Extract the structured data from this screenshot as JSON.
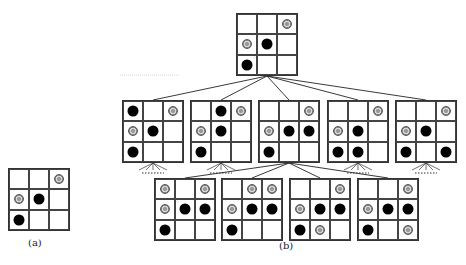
{
  "labels": {
    "a": "(a)",
    "b": "(b)"
  },
  "colors": {
    "black_stone": "#000000",
    "gray_stone": "#999999",
    "grid": "#333333"
  },
  "legend": {
    "black": "black-stone",
    "gray": "gray-stone",
    "empty": ""
  },
  "boards": {
    "a": {
      "x": 8,
      "y": 168,
      "cells": [
        "",
        "",
        "gray",
        "gray",
        "black",
        "",
        "black",
        "",
        ""
      ]
    },
    "root": {
      "x": 236,
      "y": 13,
      "cells": [
        "",
        "",
        "gray",
        "gray",
        "black",
        "",
        "black",
        "",
        ""
      ]
    },
    "mid1": {
      "x": 122,
      "y": 100,
      "cells": [
        "black",
        "",
        "gray",
        "gray",
        "black",
        "",
        "black",
        "",
        ""
      ]
    },
    "mid2": {
      "x": 190,
      "y": 100,
      "cells": [
        "",
        "black",
        "gray",
        "gray",
        "black",
        "",
        "black",
        "",
        ""
      ]
    },
    "mid3": {
      "x": 258,
      "y": 100,
      "cells": [
        "",
        "",
        "gray",
        "gray",
        "black",
        "black",
        "black",
        "",
        ""
      ]
    },
    "mid4": {
      "x": 327,
      "y": 100,
      "cells": [
        "",
        "",
        "gray",
        "gray",
        "black",
        "",
        "black",
        "black",
        ""
      ]
    },
    "mid5": {
      "x": 395,
      "y": 100,
      "cells": [
        "",
        "",
        "gray",
        "gray",
        "black",
        "",
        "black",
        "",
        "black"
      ]
    },
    "bot1": {
      "x": 154,
      "y": 178,
      "cells": [
        "gray",
        "",
        "gray",
        "gray",
        "black",
        "black",
        "black",
        "",
        ""
      ]
    },
    "bot2": {
      "x": 221,
      "y": 178,
      "cells": [
        "",
        "gray",
        "gray",
        "gray",
        "black",
        "black",
        "black",
        "",
        ""
      ]
    },
    "bot3": {
      "x": 289,
      "y": 178,
      "cells": [
        "",
        "",
        "gray",
        "gray",
        "black",
        "black",
        "black",
        "gray",
        ""
      ]
    },
    "bot4": {
      "x": 357,
      "y": 178,
      "cells": [
        "",
        "",
        "gray",
        "gray",
        "black",
        "black",
        "black",
        "",
        "gray"
      ]
    }
  },
  "edges": {
    "root_to_mid": [
      [
        267,
        76,
        153,
        100
      ],
      [
        267,
        76,
        221,
        100
      ],
      [
        267,
        76,
        289,
        100
      ],
      [
        267,
        76,
        358,
        100
      ],
      [
        267,
        76,
        426,
        100
      ]
    ],
    "mid3_to_bot": [
      [
        289,
        163,
        185,
        178
      ],
      [
        289,
        163,
        252,
        178
      ],
      [
        289,
        163,
        320,
        178
      ],
      [
        289,
        163,
        388,
        178
      ]
    ],
    "stubs": [
      {
        "cx": 153,
        "y": 163,
        "dots_y": 173
      },
      {
        "cx": 221,
        "y": 163,
        "dots_y": 173
      },
      {
        "cx": 358,
        "y": 163,
        "dots_y": 173
      },
      {
        "cx": 426,
        "y": 163,
        "dots_y": 173
      }
    ],
    "faint_line": [
      120,
      75,
      180,
      75
    ]
  }
}
